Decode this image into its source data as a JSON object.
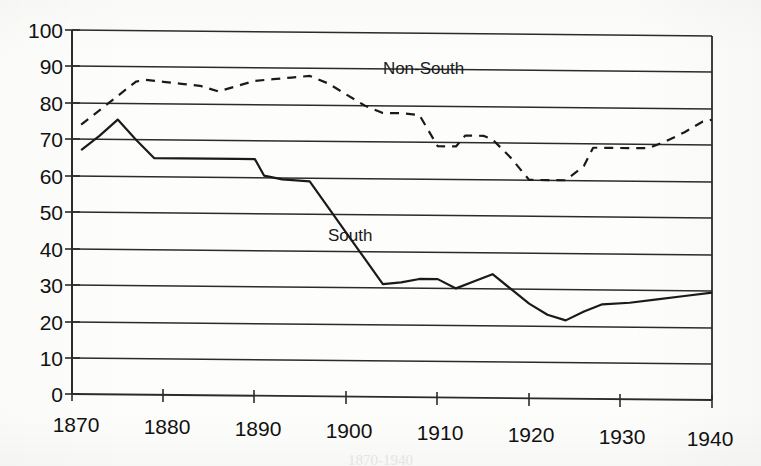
{
  "chart_data": {
    "type": "line",
    "title": "",
    "subtitle": "",
    "xlabel": "",
    "ylabel": "",
    "xlim": [
      1870,
      1940
    ],
    "ylim": [
      0,
      100
    ],
    "grid": "horizontal",
    "legend_position": "inline-annotation",
    "x_ticks": [
      "1870",
      "1880",
      "1890",
      "1900",
      "1910",
      "1920",
      "1930",
      "1940"
    ],
    "y_ticks": [
      "0",
      "10",
      "20",
      "30",
      "40",
      "50",
      "60",
      "70",
      "80",
      "90",
      "100"
    ],
    "annotations": [
      {
        "text": "Non-South",
        "x": 1904,
        "y": 90
      },
      {
        "text": "South",
        "x": 1898,
        "y": 44
      }
    ],
    "series": [
      {
        "name": "Non-South",
        "style": "dashed",
        "color": "#1a1a1a",
        "x": [
          1871,
          1873,
          1875,
          1877,
          1878,
          1880,
          1882,
          1884,
          1886,
          1888,
          1890,
          1892,
          1894,
          1896,
          1898,
          1900,
          1902,
          1904,
          1906,
          1908,
          1910,
          1912,
          1913,
          1915,
          1916,
          1918,
          1920,
          1922,
          1924,
          1926,
          1927,
          1929,
          1931,
          1933,
          1935,
          1937,
          1939,
          1940
        ],
        "values": [
          74,
          78,
          82,
          86,
          86.5,
          86,
          85.5,
          85,
          83.5,
          85,
          86.5,
          87,
          87.5,
          88,
          86,
          83,
          80,
          78,
          78,
          77.5,
          69,
          69,
          72,
          72,
          71,
          66,
          60,
          60,
          60,
          64,
          69,
          69,
          69,
          69,
          71,
          73.5,
          76.5,
          77
        ]
      },
      {
        "name": "South",
        "style": "solid",
        "color": "#1a1a1a",
        "x": [
          1871,
          1873,
          1875,
          1877,
          1879,
          1882,
          1885,
          1888,
          1890,
          1891,
          1893,
          1896,
          1898,
          1900,
          1902,
          1904,
          1906,
          1908,
          1910,
          1912,
          1914,
          1916,
          1918,
          1920,
          1922,
          1924,
          1926,
          1928,
          1931,
          1934,
          1937,
          1940
        ],
        "values": [
          67,
          71,
          75.5,
          70,
          65,
          65,
          65,
          65,
          65,
          60.5,
          59.5,
          59,
          52,
          45,
          38,
          31,
          31.5,
          32.5,
          32.5,
          30,
          32,
          34,
          30,
          26,
          23,
          21.5,
          24,
          26,
          26.5,
          27.5,
          28.5,
          29.5
        ]
      }
    ]
  },
  "caption": {
    "ghost_text": "1870-1940"
  }
}
